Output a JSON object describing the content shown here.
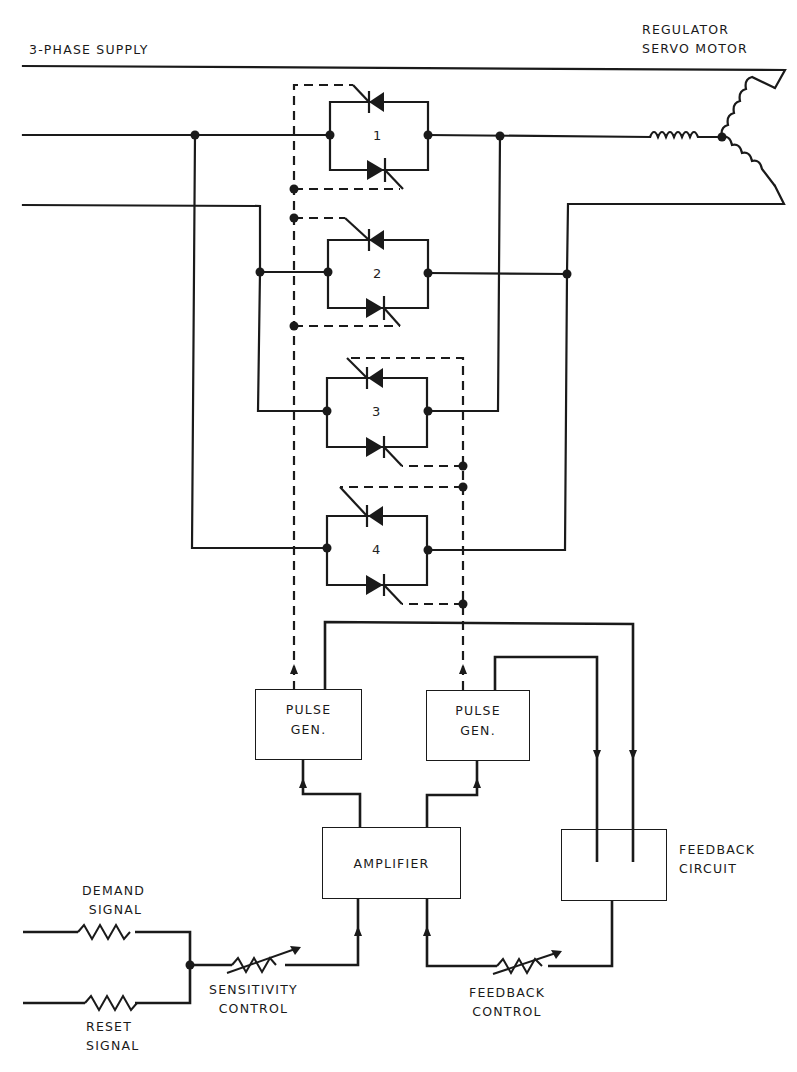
{
  "labels": {
    "supply": "3-PHASE SUPPLY",
    "motor_line1": "REGULATOR",
    "motor_line2": "SERVO MOTOR",
    "demand_line1": "DEMAND",
    "demand_line2": "SIGNAL",
    "reset_line1": "RESET",
    "reset_line2": "SIGNAL",
    "sensitivity_line1": "SENSITIVITY",
    "sensitivity_line2": "CONTROL",
    "feedback_ctrl_line1": "FEEDBACK",
    "feedback_ctrl_line2": "CONTROL",
    "feedback_circuit_line1": "FEEDBACK",
    "feedback_circuit_line2": "CIRCUIT"
  },
  "blocks": {
    "pulse_gen_1": {
      "line1": "PULSE",
      "line2": "GEN."
    },
    "pulse_gen_2": {
      "line1": "PULSE",
      "line2": "GEN."
    },
    "amplifier": {
      "label": "AMPLIFIER"
    },
    "feedback_circuit": {
      "label": ""
    }
  },
  "thyristor_pairs": [
    {
      "id": "1"
    },
    {
      "id": "2"
    },
    {
      "id": "3"
    },
    {
      "id": "4"
    }
  ],
  "style": {
    "line_color": "#1a1a1a",
    "background": "#ffffff"
  }
}
